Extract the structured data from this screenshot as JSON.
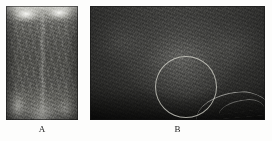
{
  "figure": {
    "background_color": "#fdfdfc",
    "panel_count": 2,
    "panels": [
      {
        "id": "A",
        "caption": "A",
        "modality": "grayscale-speckle-image",
        "orientation": "portrait",
        "description": "Narrow upright grayscale image with a bright horizontal band and two bright lobes across the top, a faint vertical midline structure down the center, and bright diffuse regions near the bottom-left and bottom-center.",
        "dominant_tone": "#5c5c58",
        "bright_tone": "#fffffc",
        "dark_tone": "#4a4a46",
        "has_annotation": false,
        "bounds": {
          "x": 6,
          "y": 6,
          "width": 72,
          "height": 114
        }
      },
      {
        "id": "B",
        "caption": "B",
        "modality": "grayscale-speckle-image",
        "orientation": "landscape",
        "description": "Wide dark grayscale image, brighter toward the upper-center and darkening toward all edges, with a thin bright curved streak in the lower-right corner.",
        "dominant_tone": "#3a3a38",
        "bright_tone": "#b9b9b4",
        "dark_tone": "#1b1b1a",
        "has_annotation": true,
        "bounds": {
          "x": 90,
          "y": 6,
          "width": 175,
          "height": 114
        },
        "annotation": {
          "type": "circle",
          "label": "region-of-interest",
          "stroke_color": "#ceceC6",
          "stroke_width_px": 1,
          "center": {
            "x": 186,
            "y": 87
          },
          "radius_px": 31
        }
      }
    ]
  },
  "captions": {
    "panel_a_label": "A",
    "panel_b_label": "B"
  }
}
